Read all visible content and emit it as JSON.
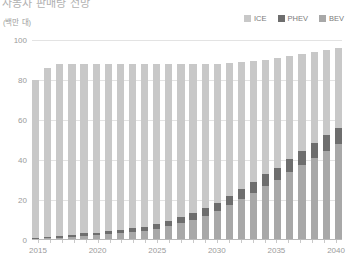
{
  "title": "자동차 판매량 전망",
  "unit_label": "(백만 대)",
  "legend": {
    "position": "top-right",
    "items": [
      {
        "label": "ICE",
        "color": "#c8c8c8"
      },
      {
        "label": "PHEV",
        "color": "#6e6e6e"
      },
      {
        "label": "BEV",
        "color": "#a8a8a8"
      }
    ]
  },
  "axes": {
    "y_ticks": [
      "100",
      "80",
      "60",
      "40",
      "20",
      "0"
    ],
    "x_ticks": [
      "2015",
      "2020",
      "2025",
      "2030",
      "2035",
      "2040"
    ]
  },
  "chart_data": {
    "type": "bar",
    "subtype": "stacked-vertical",
    "title": "자동차 판매량 전망",
    "xlabel": "",
    "ylabel": "(백만 대)",
    "ylim": [
      0,
      100
    ],
    "yticks": [
      0,
      20,
      40,
      60,
      80,
      100
    ],
    "grid": true,
    "legend_position": "top-right",
    "categories": [
      "2015",
      "2016",
      "2017",
      "2018",
      "2019",
      "2020",
      "2021",
      "2022",
      "2023",
      "2024",
      "2025",
      "2026",
      "2027",
      "2028",
      "2029",
      "2030",
      "2031",
      "2032",
      "2033",
      "2034",
      "2035",
      "2036",
      "2037",
      "2038",
      "2039",
      "2040"
    ],
    "stack_order_bottom_to_top": [
      "BEV",
      "PHEV",
      "ICE"
    ],
    "series": [
      {
        "name": "BEV",
        "color": "#a8a8a8",
        "values": [
          0.5,
          0.8,
          1.2,
          1.7,
          2.2,
          2.5,
          3.0,
          3.5,
          4.0,
          4.5,
          5.5,
          7.0,
          8.5,
          10.0,
          12.0,
          14.5,
          17.5,
          20.5,
          23.5,
          27.0,
          30.0,
          34.0,
          37.5,
          41.0,
          44.5,
          48.0
        ]
      },
      {
        "name": "PHEV",
        "color": "#6e6e6e",
        "values": [
          0.3,
          0.5,
          0.7,
          0.9,
          1.1,
          1.2,
          1.4,
          1.6,
          1.8,
          2.0,
          2.3,
          2.6,
          3.0,
          3.4,
          3.8,
          4.2,
          4.6,
          5.0,
          5.4,
          5.8,
          6.2,
          6.6,
          7.0,
          7.4,
          7.8,
          8.2
        ]
      },
      {
        "name": "ICE",
        "color": "#c8c8c8",
        "values": [
          79.2,
          84.7,
          86.1,
          85.4,
          84.7,
          84.3,
          83.6,
          82.9,
          82.2,
          81.5,
          80.2,
          78.4,
          76.5,
          74.6,
          72.2,
          69.3,
          66.4,
          63.5,
          60.6,
          57.2,
          54.8,
          51.4,
          48.5,
          45.6,
          42.7,
          39.8
        ]
      }
    ],
    "totals": [
      80,
      86,
      88,
      88,
      88,
      88,
      88,
      88,
      88,
      88,
      88,
      88,
      88,
      88,
      88,
      88,
      88.5,
      89,
      89.5,
      90,
      91,
      92,
      93,
      94,
      95,
      96
    ]
  }
}
